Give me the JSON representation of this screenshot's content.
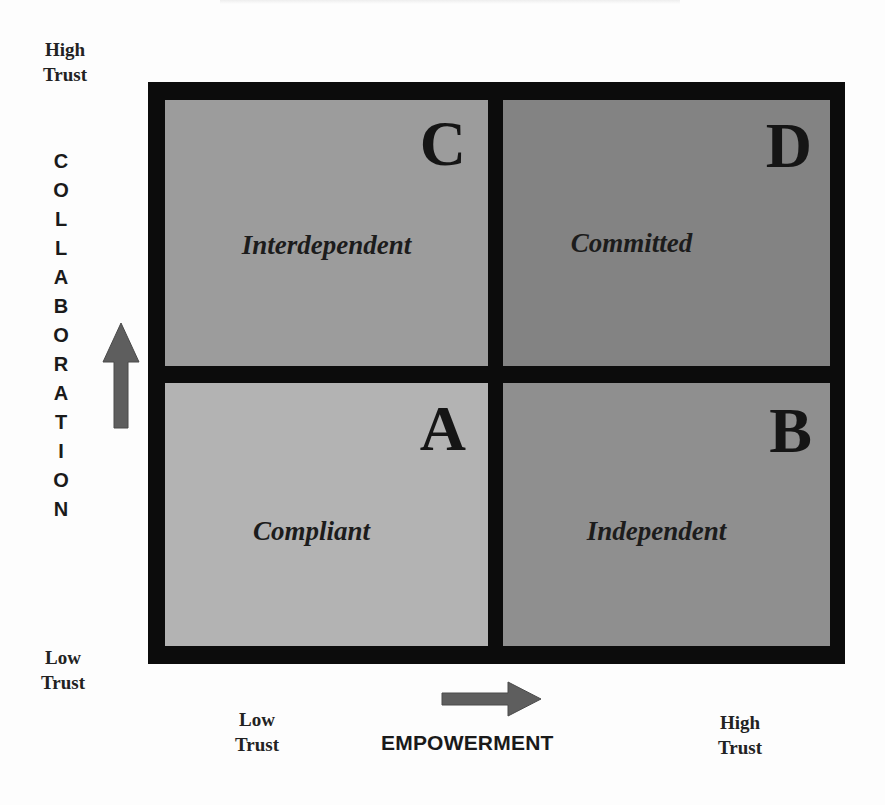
{
  "diagram": {
    "type": "2x2-matrix",
    "vertical_axis": {
      "title": "COLLABORATION",
      "top_label": [
        "High",
        "Trust"
      ],
      "bottom_label": [
        "Low",
        "Trust"
      ],
      "direction": "up"
    },
    "horizontal_axis": {
      "title": "EMPOWERMENT",
      "left_label": [
        "Low",
        "Trust"
      ],
      "right_label": [
        "High",
        "Trust"
      ],
      "direction": "right"
    },
    "quadrants": {
      "c": {
        "letter": "C",
        "name": "Interdependent",
        "position": "top-left",
        "color": "#9c9c9c"
      },
      "d": {
        "letter": "D",
        "name": "Committed",
        "position": "top-right",
        "color": "#838383"
      },
      "a": {
        "letter": "A",
        "name": "Compliant",
        "position": "bottom-left",
        "color": "#b3b3b3"
      },
      "b": {
        "letter": "B",
        "name": "Independent",
        "position": "bottom-right",
        "color": "#8f8f8f"
      }
    },
    "colors": {
      "border": "#0c0c0c",
      "arrow": "#5e5e5e",
      "background": "#fdfdfd"
    }
  }
}
